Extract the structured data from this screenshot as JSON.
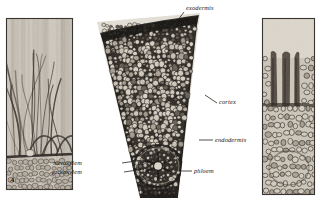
{
  "figure": {
    "background_color": "#ffffff",
    "panels": [
      {
        "id": "panel-a",
        "name": "longitudinal-root-hair-section",
        "corner_letter": "A",
        "description": "longitudinal section showing root hairs above epidermis",
        "x": 6,
        "y": 18,
        "width": 67,
        "height": 172,
        "border_color": "#3a3530",
        "tone_light": "#cfc8bd",
        "tone_mid": "#a79e92",
        "tone_dark": "#4a443c"
      },
      {
        "id": "panel-b",
        "name": "root-cross-section-wedge",
        "description": "wedge-shaped transverse section of root showing cortex and stele",
        "x": 83,
        "y": 12,
        "width": 130,
        "height": 188,
        "tone_light": "#d8d2c8",
        "tone_mid": "#8d857a",
        "tone_dark": "#17140f"
      },
      {
        "id": "panel-c",
        "name": "root-hair-longitudinal-detail",
        "description": "detail of root hair emerging from epidermal cells",
        "x": 262,
        "y": 18,
        "width": 53,
        "height": 177,
        "border_color": "#3a3530",
        "tone_light": "#cbc4b8",
        "tone_mid": "#8f8577",
        "tone_dark": "#2d2823"
      }
    ],
    "labels": [
      {
        "id": "exodermis",
        "text": "exodermis",
        "x": 186,
        "y": 5,
        "align": "left",
        "leader": {
          "x1": 184,
          "y1": 12,
          "x2": 168,
          "y2": 33
        }
      },
      {
        "id": "cortex",
        "text": "cortex",
        "x": 219,
        "y": 99,
        "align": "left",
        "leader": {
          "x1": 217,
          "y1": 103,
          "x2": 205,
          "y2": 95
        }
      },
      {
        "id": "endodermis",
        "text": "endodermis",
        "x": 215,
        "y": 137,
        "align": "left",
        "leader": {
          "x1": 213,
          "y1": 140,
          "x2": 199,
          "y2": 140
        }
      },
      {
        "id": "phloem",
        "text": "phloem",
        "x": 194,
        "y": 168,
        "align": "left",
        "leader": {
          "x1": 192,
          "y1": 171,
          "x2": 180,
          "y2": 171
        }
      },
      {
        "id": "metaxylem",
        "text": "metaxylem",
        "x": 82,
        "y": 160,
        "align": "right",
        "leader": {
          "x1": 122,
          "y1": 163,
          "x2": 143,
          "y2": 160
        }
      },
      {
        "id": "protoxylem",
        "text": "protoxylem",
        "x": 82,
        "y": 169,
        "align": "right",
        "leader": {
          "x1": 124,
          "y1": 172,
          "x2": 144,
          "y2": 169
        }
      }
    ],
    "label_color": "#15120f",
    "leader_color": "#2a2521"
  }
}
